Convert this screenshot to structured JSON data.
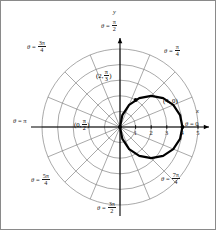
{
  "figure": {
    "background": "#ffffff",
    "border_color": "#8a8a8a"
  },
  "axes": {
    "x_axis_name": "x",
    "y_axis_name": "y",
    "axis_color": "#000000",
    "grid_color": "#6f6f6f"
  },
  "x_ticks": [
    {
      "label": "1",
      "value": 1
    },
    {
      "label": "2",
      "value": 2
    },
    {
      "label": "3",
      "value": 3
    },
    {
      "label": "4",
      "value": 4
    },
    {
      "label": "5",
      "value": 5
    }
  ],
  "angle_labels": [
    {
      "name": "theta-0",
      "theta_text": "θ = 0",
      "eq": "θ =",
      "value_whole": "0",
      "num": "",
      "den": "",
      "radians": 0.0
    },
    {
      "name": "theta-pi-4",
      "theta_text": "θ = π/4",
      "eq": "θ =",
      "value_whole": "",
      "num": "π",
      "den": "4",
      "radians": 0.7853981634
    },
    {
      "name": "theta-pi-2",
      "theta_text": "θ = π/2",
      "eq": "θ =",
      "value_whole": "",
      "num": "π",
      "den": "2",
      "radians": 1.5707963268
    },
    {
      "name": "theta-3pi-4",
      "theta_text": "θ = 3π/4",
      "eq": "θ =",
      "value_whole": "",
      "num": "3π",
      "den": "4",
      "radians": 2.3561944902
    },
    {
      "name": "theta-pi",
      "theta_text": "θ = π",
      "eq": "θ =",
      "value_whole": "π",
      "num": "",
      "den": "",
      "radians": 3.1415926536
    },
    {
      "name": "theta-5pi-4",
      "theta_text": "θ = 5π/4",
      "eq": "θ =",
      "value_whole": "",
      "num": "5π",
      "den": "4",
      "radians": 3.926990817
    },
    {
      "name": "theta-3pi-2",
      "theta_text": "θ = 3π/2",
      "eq": "θ =",
      "value_whole": "",
      "num": "3π",
      "den": "2",
      "radians": 4.7123889804
    },
    {
      "name": "theta-7pi-4",
      "theta_text": "θ = 7π/4",
      "eq": "θ =",
      "value_whole": "",
      "num": "7π",
      "den": "4",
      "radians": 5.4977871438
    }
  ],
  "point_labels": [
    {
      "name": "point-2-pi-3",
      "open": "(2,",
      "num": "π",
      "den": "3",
      "close": ")",
      "r": 2,
      "theta_radians": 1.0471975512,
      "has_marker": true
    },
    {
      "name": "point-0-pi-2",
      "open": "(0,",
      "num": "π",
      "den": "2",
      "close": ")",
      "r": 0,
      "theta_radians": 1.5707963268,
      "has_marker": false
    },
    {
      "name": "point-4-0",
      "open": "(4, 0)",
      "num": "",
      "den": "",
      "close": "",
      "r": 4,
      "theta_radians": 0.0,
      "has_marker": true
    }
  ],
  "chart_data": {
    "type": "line",
    "coordinate_system": "polar",
    "title": "",
    "xlabel": "x",
    "ylabel": "y",
    "equation": "r = 4 cos θ",
    "curve_description": "circle of radius 2 centered at (2, 0) passing through the pole and (4, 0)",
    "curve_color": "#000000",
    "curve_linewidth": 2.2,
    "grid": true,
    "grid_circles_r": [
      1,
      2,
      3,
      4,
      5
    ],
    "grid_spoke_count": 16,
    "grid_spoke_step_radians": 0.3926990817,
    "r_max": 5,
    "xlim": [
      -5,
      5
    ],
    "ylim": [
      -5,
      5
    ],
    "marked_points": [
      {
        "label": "(4, 0)",
        "r": 4,
        "theta": 0.0,
        "x": 4.0,
        "y": 0.0
      },
      {
        "label": "(2, π/3)",
        "r": 2,
        "theta": 1.0471975512,
        "x": 1.0,
        "y": 1.7320508076
      },
      {
        "label": "(0, π/2)",
        "r": 0,
        "theta": 1.5707963268,
        "x": 0.0,
        "y": 0.0
      }
    ],
    "series": [
      {
        "name": "r = 4 cos θ",
        "theta": [
          0.0,
          0.1963,
          0.3927,
          0.589,
          0.7854,
          0.9817,
          1.1781,
          1.3744,
          1.5708,
          1.7671,
          1.9635,
          2.1598,
          2.3562,
          2.5525,
          2.7489,
          2.9452,
          3.1416
        ],
        "r": [
          4.0,
          3.924,
          3.696,
          3.326,
          2.828,
          2.222,
          1.531,
          0.78,
          0.0,
          -0.78,
          -1.531,
          -2.222,
          -2.828,
          -3.326,
          -3.696,
          -3.924,
          -4.0
        ]
      }
    ]
  }
}
